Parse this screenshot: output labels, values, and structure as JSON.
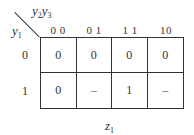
{
  "kmap": {
    "title_var": {
      "base": "z",
      "sub": "1"
    },
    "col_var": [
      {
        "base": "y",
        "sub": "2"
      },
      {
        "base": "y",
        "sub": "3"
      }
    ],
    "row_var": {
      "base": "y",
      "sub": "1"
    },
    "col_headers": [
      "0 0",
      "0 1",
      "1 1",
      "10"
    ],
    "row_headers": [
      "0",
      "1"
    ],
    "cells": [
      [
        "0",
        "0",
        "0",
        "0"
      ],
      [
        "0",
        "–",
        "1",
        "–"
      ]
    ]
  }
}
